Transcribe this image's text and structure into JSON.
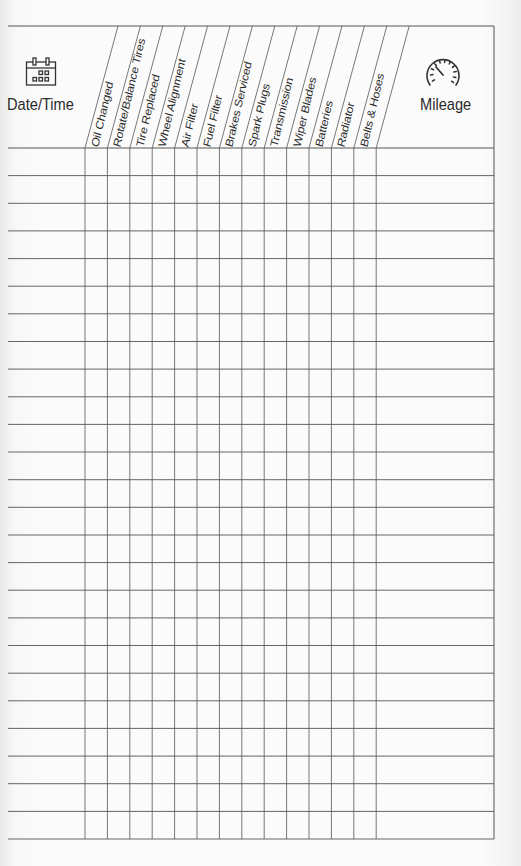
{
  "log": {
    "date_column": {
      "label": "Date/Time",
      "icon": "calendar-icon"
    },
    "mileage_column": {
      "label": "Mileage",
      "icon": "speedometer-icon"
    },
    "service_columns": [
      {
        "label": "Oil Changed"
      },
      {
        "label": "Rotate/Balance Tires"
      },
      {
        "label": "Tire Replaced"
      },
      {
        "label": "Wheel Alignment"
      },
      {
        "label": "Air Filter"
      },
      {
        "label": "Fuel Filter"
      },
      {
        "label": "Brakes Serviced"
      },
      {
        "label": "Spark Plugs"
      },
      {
        "label": "Transmission"
      },
      {
        "label": "Wiper Blades"
      },
      {
        "label": "Batteries"
      },
      {
        "label": "Radiator"
      },
      {
        "label": "Belts & Hoses"
      }
    ],
    "row_count": 25,
    "colors": {
      "line": "#555555",
      "text": "#2b2b2b",
      "paper": "#fbfbfb"
    }
  }
}
